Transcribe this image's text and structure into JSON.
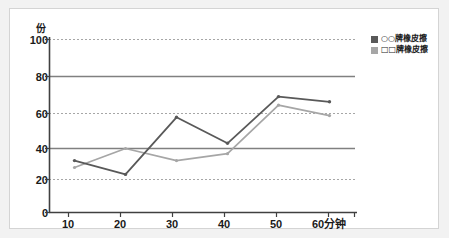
{
  "chart_data": {
    "type": "line",
    "title": "",
    "xlabel": "分钟",
    "ylabel": "份",
    "x": [
      10,
      20,
      30,
      40,
      50,
      60
    ],
    "xtick_labels": [
      "10",
      "20",
      "30",
      "40",
      "50",
      "60分钟"
    ],
    "ytick_labels": [
      "0",
      "20",
      "40",
      "60",
      "80",
      "100"
    ],
    "yticks": [
      0,
      20,
      40,
      60,
      80,
      100
    ],
    "ylim": [
      0,
      100
    ],
    "xlim": [
      5,
      65
    ],
    "grid": "horizontal",
    "gridlines_solid": [
      40,
      80
    ],
    "gridlines_dotted": [
      20,
      60,
      100
    ],
    "legend_position": "top-right",
    "series": [
      {
        "name": "○○牌橡皮擦",
        "color": "#595959",
        "values": [
          30,
          22,
          55,
          40,
          67,
          64
        ]
      },
      {
        "name": "□□牌橡皮擦",
        "color": "#a6a6a6",
        "values": [
          26,
          37,
          30,
          34,
          62,
          56
        ]
      }
    ]
  },
  "axes": {
    "y_unit": "份",
    "y_ticks": [
      {
        "label": "100",
        "value": 100
      },
      {
        "label": "80",
        "value": 80
      },
      {
        "label": "60",
        "value": 60
      },
      {
        "label": "40",
        "value": 40
      },
      {
        "label": "20",
        "value": 20
      },
      {
        "label": "0",
        "value": 0
      }
    ],
    "x_ticks": [
      {
        "label": "10",
        "value": 10
      },
      {
        "label": "20",
        "value": 20
      },
      {
        "label": "30",
        "value": 30
      },
      {
        "label": "40",
        "value": 40
      },
      {
        "label": "50",
        "value": 50
      },
      {
        "label": "60分钟",
        "value": 60
      }
    ]
  },
  "legend": {
    "items": [
      {
        "label": "○○牌橡皮擦",
        "color": "#595959"
      },
      {
        "label": "□□牌橡皮擦",
        "color": "#a6a6a6"
      }
    ]
  },
  "colors": {
    "series_dark": "#595959",
    "series_light": "#a6a6a6",
    "axis": "#404040",
    "gridline_solid": "#808080",
    "gridline_dotted": "#a6a6a6",
    "frame_border": "#d4d4d4",
    "page_background": "#f2f2f2",
    "plot_background": "#ffffff"
  }
}
